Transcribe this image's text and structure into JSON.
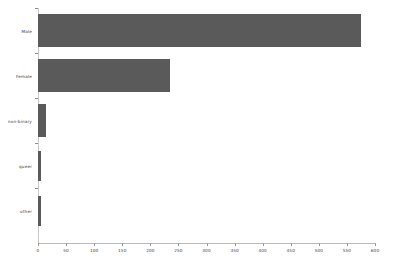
{
  "chart_data": {
    "type": "bar",
    "orientation": "horizontal",
    "title": "",
    "subtitle": "",
    "xlabel": "",
    "ylabel": "",
    "categories": [
      "Male",
      "Female",
      "non-binary",
      "queer",
      "other"
    ],
    "values": [
      575,
      235,
      15,
      5,
      6
    ],
    "series": [
      {
        "name": "count",
        "values": [
          575,
          235,
          15,
          5,
          6
        ]
      }
    ],
    "xlim": [
      0,
      600
    ],
    "xticks": [
      0,
      50,
      100,
      150,
      200,
      250,
      300,
      350,
      400,
      450,
      500,
      550,
      600
    ],
    "xticklabels": [
      "0",
      "50",
      "100",
      "150",
      "200",
      "250",
      "300",
      "350",
      "400",
      "450",
      "500",
      "550",
      "600"
    ],
    "grid": false,
    "legend": false,
    "legend_position": "none",
    "bar_color": "#5a5a5a",
    "background_color": "#ffffff",
    "axis_color": "#b8b8b8",
    "tick_label_color": "#3d3d3d"
  }
}
